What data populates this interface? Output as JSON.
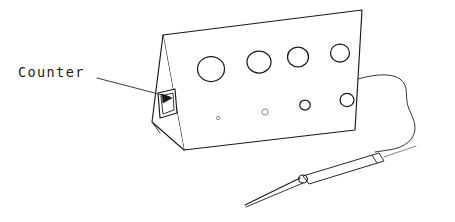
{
  "figure": {
    "background_color": "#ffffff",
    "ink_color": "#1a1a1a",
    "width": 455,
    "height": 222
  },
  "annotation": {
    "label": "Counter",
    "label_x": 18,
    "label_y": 77,
    "leader_line": {
      "from_x": 97,
      "from_y": 78,
      "to_x": 170,
      "to_y": 97
    },
    "arrow_points_to": "counter-display-window"
  },
  "enclosure": {
    "name": "wedge-shaped instrument case",
    "front_panel_corners": [
      [
        163,
        35
      ],
      [
        362,
        10
      ],
      [
        355,
        130
      ],
      [
        184,
        150
      ]
    ],
    "left_end_triangle": [
      [
        163,
        35
      ],
      [
        184,
        150
      ],
      [
        152,
        122
      ]
    ],
    "bottom_left_edge": [
      [
        152,
        122
      ],
      [
        184,
        150
      ]
    ],
    "right_edge": [
      [
        362,
        10
      ],
      [
        355,
        130
      ]
    ]
  },
  "display_window": {
    "name": "counter-display-window",
    "shape": "parallelogram",
    "points": [
      [
        158,
        93
      ],
      [
        175,
        89
      ],
      [
        177,
        113
      ],
      [
        160,
        118
      ]
    ]
  },
  "top_row_holes": [
    {
      "cx": 211,
      "cy": 69,
      "rx": 13.5,
      "ry": 12.5,
      "style": "strong"
    },
    {
      "cx": 259,
      "cy": 62,
      "rx": 12.0,
      "ry": 11.0,
      "style": "strong"
    },
    {
      "cx": 298,
      "cy": 57,
      "rx": 10.5,
      "ry": 9.8,
      "style": "strong"
    },
    {
      "cx": 340,
      "cy": 53,
      "rx": 9.5,
      "ry": 9.0,
      "style": "strong"
    }
  ],
  "bottom_row_holes": [
    {
      "cx": 218,
      "cy": 118,
      "rx": 1.6,
      "ry": 1.6,
      "style": "faint"
    },
    {
      "cx": 265,
      "cy": 112,
      "rx": 3.1,
      "ry": 3.1,
      "style": "faint"
    },
    {
      "cx": 305,
      "cy": 105,
      "rx": 5.2,
      "ry": 5.0,
      "style": "strong"
    },
    {
      "cx": 347,
      "cy": 100,
      "rx": 7.0,
      "ry": 6.6,
      "style": "strong"
    }
  ],
  "cable": {
    "name": "probe-cable",
    "path": "M 358 79 C 375 74 392 73 400 79 C 410 86 404 98 409 109 C 414 120 418 128 412 138 C 404 150 386 150 375 152"
  },
  "probe": {
    "name": "handheld-probe",
    "body_outline": [
      [
        303,
        176
      ],
      [
        379,
        153
      ],
      [
        384,
        161
      ],
      [
        309,
        184
      ]
    ],
    "cap_line": {
      "x1": 379,
      "y1": 153,
      "x2": 384,
      "y2": 161
    },
    "tip_point": [
      245,
      205
    ],
    "tip_base": [
      303,
      180
    ],
    "collar_center": [
      303,
      179
    ],
    "collar_r": 4.2,
    "cable_tail": {
      "x1": 384,
      "y1": 157,
      "x2": 414,
      "y2": 147
    }
  }
}
